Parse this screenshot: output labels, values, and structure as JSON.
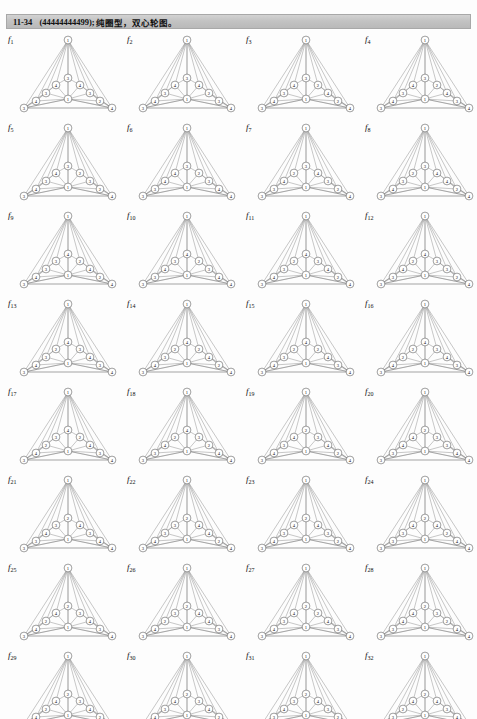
{
  "folio": "",
  "header": {
    "number": "11-34",
    "code": "(44444444499);",
    "description": "纯圈型，双心轮图。"
  },
  "figure_prefix": "f",
  "graph": {
    "apex_label": "1",
    "center_label": "1",
    "bottom_left_label": "3",
    "bottom_right_label": "4"
  },
  "figures": [
    {
      "name": "f1",
      "sub": "1",
      "top": "3",
      "u1": "4",
      "u2": "4",
      "m1": "3",
      "m2": "3",
      "l1": "4",
      "l2": "2"
    },
    {
      "name": "f2",
      "sub": "2",
      "top": "3",
      "u1": "4",
      "u2": "4",
      "m1": "3",
      "m2": "2",
      "l1": "4",
      "l2": "3"
    },
    {
      "name": "f3",
      "sub": "3",
      "top": "3",
      "u1": "4",
      "u2": "2",
      "m1": "3",
      "m2": "4",
      "l1": "4",
      "l2": "2"
    },
    {
      "name": "f4",
      "sub": "4",
      "top": "3",
      "u1": "4",
      "u2": "2",
      "m1": "3",
      "m2": "4",
      "l1": "4",
      "l2": "3"
    },
    {
      "name": "f5",
      "sub": "5",
      "top": "3",
      "u1": "4",
      "u2": "2",
      "m1": "3",
      "m2": "3",
      "l1": "4",
      "l2": "2"
    },
    {
      "name": "f6",
      "sub": "6",
      "top": "3",
      "u1": "4",
      "u2": "2",
      "m1": "4",
      "m2": "3",
      "l1": "3",
      "l2": "4"
    },
    {
      "name": "f7",
      "sub": "7",
      "top": "3",
      "u1": "2",
      "u2": "4",
      "m1": "4",
      "m2": "3",
      "l1": "3",
      "l2": "2"
    },
    {
      "name": "f8",
      "sub": "8",
      "top": "3",
      "u1": "2",
      "u2": "4",
      "m1": "3",
      "m2": "4",
      "l1": "4",
      "l2": "2"
    },
    {
      "name": "f9",
      "sub": "9",
      "top": "4",
      "u1": "3",
      "u2": "2",
      "m1": "3",
      "m2": "4",
      "l1": "4",
      "l2": "2"
    },
    {
      "name": "f10",
      "sub": "10",
      "top": "4",
      "u1": "3",
      "u2": "2",
      "m1": "4",
      "m2": "3",
      "l1": "3",
      "l2": "4"
    },
    {
      "name": "f11",
      "sub": "11",
      "top": "4",
      "u1": "2",
      "u2": "3",
      "m1": "3",
      "m2": "4",
      "l1": "4",
      "l2": "2"
    },
    {
      "name": "f12",
      "sub": "12",
      "top": "4",
      "u1": "2",
      "u2": "3",
      "m1": "4",
      "m2": "3",
      "l1": "3",
      "l2": "2"
    },
    {
      "name": "f13",
      "sub": "13",
      "top": "4",
      "u1": "2",
      "u2": "3",
      "m1": "3",
      "m2": "4",
      "l1": "4",
      "l2": "3"
    },
    {
      "name": "f14",
      "sub": "14",
      "top": "4",
      "u1": "2",
      "u2": "2",
      "m1": "3",
      "m2": "4",
      "l1": "4",
      "l2": "2"
    },
    {
      "name": "f15",
      "sub": "15",
      "top": "4",
      "u1": "2",
      "u2": "2",
      "m1": "3",
      "m2": "4",
      "l1": "4",
      "l2": "3"
    },
    {
      "name": "f16",
      "sub": "16",
      "top": "4",
      "u1": "2",
      "u2": "3",
      "m1": "2",
      "m2": "4",
      "l1": "4",
      "l2": "3"
    },
    {
      "name": "f17",
      "sub": "17",
      "top": "4",
      "u1": "3",
      "u2": "2",
      "m1": "2",
      "m2": "4",
      "l1": "4",
      "l2": "3"
    },
    {
      "name": "f18",
      "sub": "18",
      "top": "4",
      "u1": "2",
      "u2": "3",
      "m1": "4",
      "m2": "2",
      "l1": "3",
      "l2": "4"
    },
    {
      "name": "f19",
      "sub": "19",
      "top": "2",
      "u1": "4",
      "u2": "3",
      "m1": "3",
      "m2": "4",
      "l1": "4",
      "l2": "2"
    },
    {
      "name": "f20",
      "sub": "20",
      "top": "2",
      "u1": "4",
      "u2": "3",
      "m1": "4",
      "m2": "3",
      "l1": "3",
      "l2": "4"
    },
    {
      "name": "f21",
      "sub": "21",
      "top": "2",
      "u1": "3",
      "u2": "4",
      "m1": "4",
      "m2": "3",
      "l1": "3",
      "l2": "4"
    },
    {
      "name": "f22",
      "sub": "22",
      "top": "2",
      "u1": "3",
      "u2": "4",
      "m1": "3",
      "m2": "4",
      "l1": "4",
      "l2": "2"
    },
    {
      "name": "f23",
      "sub": "23",
      "top": "2",
      "u1": "4",
      "u2": "4",
      "m1": "3",
      "m2": "3",
      "l1": "4",
      "l2": "2"
    },
    {
      "name": "f24",
      "sub": "24",
      "top": "2",
      "u1": "4",
      "u2": "4",
      "m1": "3",
      "m2": "2",
      "l1": "3",
      "l2": "4"
    },
    {
      "name": "f25",
      "sub": "25",
      "top": "2",
      "u1": "4",
      "u2": "3",
      "m1": "2",
      "m2": "4",
      "l1": "4",
      "l2": "3"
    },
    {
      "name": "f26",
      "sub": "26",
      "top": "2",
      "u1": "3",
      "u2": "4",
      "m1": "2",
      "m2": "4",
      "l1": "4",
      "l2": "3"
    },
    {
      "name": "f27",
      "sub": "27",
      "top": "2",
      "u1": "4",
      "u2": "2",
      "m1": "3",
      "m2": "4",
      "l1": "4",
      "l2": "3"
    },
    {
      "name": "f28",
      "sub": "28",
      "top": "2",
      "u1": "4",
      "u2": "3",
      "m1": "4",
      "m2": "2",
      "l1": "3",
      "l2": "4"
    },
    {
      "name": "f29",
      "sub": "29",
      "top": "2",
      "u1": "4",
      "u2": "3",
      "m1": "2",
      "m2": "4",
      "l1": "4",
      "l2": "2"
    },
    {
      "name": "f30",
      "sub": "30",
      "top": "2",
      "u1": "4",
      "u2": "3",
      "m1": "3",
      "m2": "4",
      "l1": "4",
      "l2": "2"
    },
    {
      "name": "f31",
      "sub": "31",
      "top": "2",
      "u1": "3",
      "u2": "4",
      "m1": "4",
      "m2": "3",
      "l1": "3",
      "l2": "2"
    },
    {
      "name": "f32",
      "sub": "32",
      "top": "2",
      "u1": "4",
      "u2": "4",
      "m1": "2",
      "m2": "3",
      "l1": "3",
      "l2": "4"
    }
  ],
  "layout": {
    "columns": 4,
    "rows": 8,
    "col_pitch": 119,
    "row_pitch": 88
  }
}
